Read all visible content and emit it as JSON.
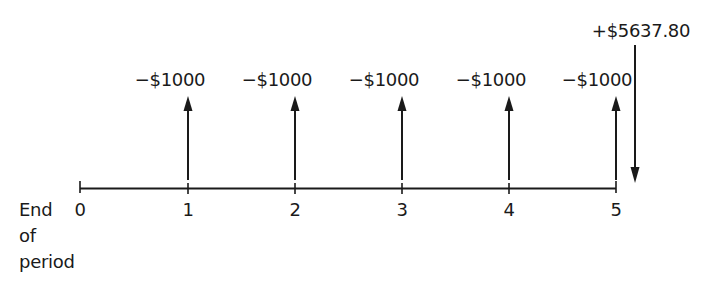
{
  "diagram": {
    "type": "cash-flow-timeline",
    "axis_label": [
      "End",
      "of",
      "period"
    ],
    "periods": [
      "0",
      "1",
      "2",
      "3",
      "4",
      "5"
    ],
    "payments": [
      {
        "period": "1",
        "label": "−$1000",
        "direction": "up"
      },
      {
        "period": "2",
        "label": "−$1000",
        "direction": "up"
      },
      {
        "period": "3",
        "label": "−$1000",
        "direction": "up"
      },
      {
        "period": "4",
        "label": "−$1000",
        "direction": "up"
      },
      {
        "period": "5",
        "label": "−$1000",
        "direction": "up"
      }
    ],
    "receipt": {
      "period": "5",
      "label": "+$5637.80",
      "direction": "down"
    },
    "colors": {
      "line": "#1a1a1a",
      "background": "#ffffff"
    }
  }
}
